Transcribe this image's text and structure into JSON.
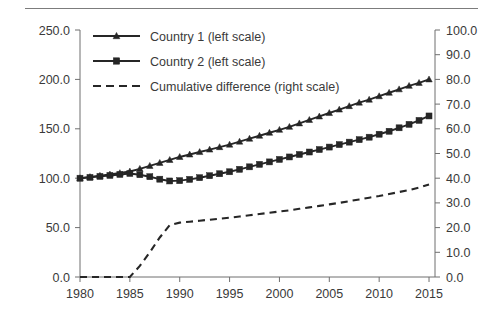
{
  "chart_data": {
    "type": "line",
    "title": "",
    "xlabel": "",
    "ylabel": "",
    "y2label": "",
    "grid": false,
    "legend_position": "top-left inside",
    "xlim": [
      1980,
      2015.6
    ],
    "ylim": [
      0.0,
      250.0
    ],
    "y2lim": [
      0.0,
      100.0
    ],
    "xticks": [
      1980,
      1985,
      1990,
      1995,
      2000,
      2005,
      2010,
      2015
    ],
    "xticklabels": [
      "1980",
      "1985",
      "1990",
      "1995",
      "2000",
      "2005",
      "2010",
      "2015"
    ],
    "yticks": [
      0.0,
      50.0,
      100.0,
      150.0,
      200.0,
      250.0
    ],
    "yticklabels": [
      "0.0",
      "50.0",
      "100.0",
      "150.0",
      "200.0",
      "250.0"
    ],
    "y2ticks": [
      0.0,
      10.0,
      20.0,
      30.0,
      40.0,
      50.0,
      60.0,
      70.0,
      80.0,
      90.0,
      100.0
    ],
    "y2ticklabels": [
      "0.0",
      "10.0",
      "20.0",
      "30.0",
      "40.0",
      "50.0",
      "60.0",
      "70.0",
      "80.0",
      "90.0",
      "100.0"
    ],
    "x": [
      1980,
      1981,
      1982,
      1983,
      1984,
      1985,
      1986,
      1987,
      1988,
      1989,
      1990,
      1991,
      1992,
      1993,
      1994,
      1995,
      1996,
      1997,
      1998,
      1999,
      2000,
      2001,
      2002,
      2003,
      2004,
      2005,
      2006,
      2007,
      2008,
      2009,
      2010,
      2011,
      2012,
      2013,
      2014,
      2015
    ],
    "series": [
      {
        "name": "Country 1 (left scale)",
        "axis": "left",
        "marker": "triangle",
        "style": "solid",
        "values": [
          100.0,
          101.2,
          102.5,
          103.8,
          105.2,
          106.8,
          109.5,
          112.5,
          115.5,
          118.5,
          121.5,
          124.0,
          126.5,
          129.0,
          131.5,
          134.0,
          137.0,
          140.0,
          143.0,
          146.0,
          149.0,
          152.0,
          155.5,
          159.0,
          162.5,
          166.0,
          169.5,
          173.0,
          176.5,
          179.5,
          183.0,
          186.5,
          190.0,
          193.5,
          196.5,
          200.0
        ]
      },
      {
        "name": "Country 2 (left scale)",
        "axis": "left",
        "marker": "square",
        "style": "solid",
        "values": [
          100.0,
          100.8,
          101.8,
          102.8,
          103.8,
          104.8,
          103.5,
          101.5,
          99.0,
          97.2,
          97.5,
          98.8,
          100.5,
          102.5,
          104.5,
          106.5,
          109.0,
          111.5,
          114.0,
          116.5,
          119.0,
          121.5,
          124.0,
          126.5,
          129.0,
          131.5,
          134.0,
          136.5,
          139.0,
          141.5,
          144.5,
          147.5,
          151.0,
          154.5,
          158.5,
          163.0
        ]
      },
      {
        "name": "Cumulative difference (right scale)",
        "axis": "right",
        "marker": "none",
        "style": "dashed",
        "values": [
          0.0,
          0.0,
          0.0,
          0.0,
          0.0,
          0.0,
          4.5,
          10.0,
          16.0,
          21.0,
          22.0,
          22.4,
          22.8,
          23.2,
          23.6,
          24.0,
          24.5,
          25.0,
          25.5,
          26.0,
          26.5,
          27.0,
          27.6,
          28.2,
          28.8,
          29.4,
          30.0,
          30.7,
          31.4,
          32.1,
          32.8,
          33.6,
          34.4,
          35.2,
          36.2,
          37.5
        ]
      }
    ],
    "legend": [
      {
        "label": "Country 1 (left scale)",
        "marker": "triangle",
        "style": "solid"
      },
      {
        "label": "Country 2 (left scale)",
        "marker": "square",
        "style": "solid"
      },
      {
        "label": "Cumulative difference (right scale)",
        "marker": "none",
        "style": "dashed"
      }
    ]
  }
}
